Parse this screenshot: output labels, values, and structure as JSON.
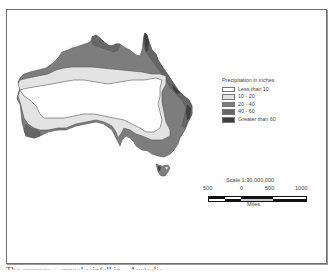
{
  "map": {
    "subject": "Australia precipitation map",
    "colors": {
      "less_than_10": "#ffffff",
      "10_20": "#e3e3e3",
      "20_40": "#7d7d7d",
      "40_60": "#666666",
      "greater_than_60": "#3e3e3e",
      "outline": "#555555"
    }
  },
  "legend": {
    "title": "Precipitation in inches",
    "items": [
      {
        "label": "Less than 10",
        "color": "#ffffff"
      },
      {
        "label": "10 - 20",
        "color": "#e3e3e3"
      },
      {
        "label": "20 - 40",
        "color": "#7d7d7d"
      },
      {
        "label": "40 - 60",
        "color": "#666666"
      },
      {
        "label": "Greater than 60",
        "color": "#3e3e3e"
      }
    ]
  },
  "scale": {
    "title": "Scale 1:30,000,000",
    "ticks": [
      "500",
      "0",
      "500",
      "1000"
    ],
    "units": "Miles"
  },
  "caption": {
    "text": "The average…annual rainfall in…Australia…"
  }
}
